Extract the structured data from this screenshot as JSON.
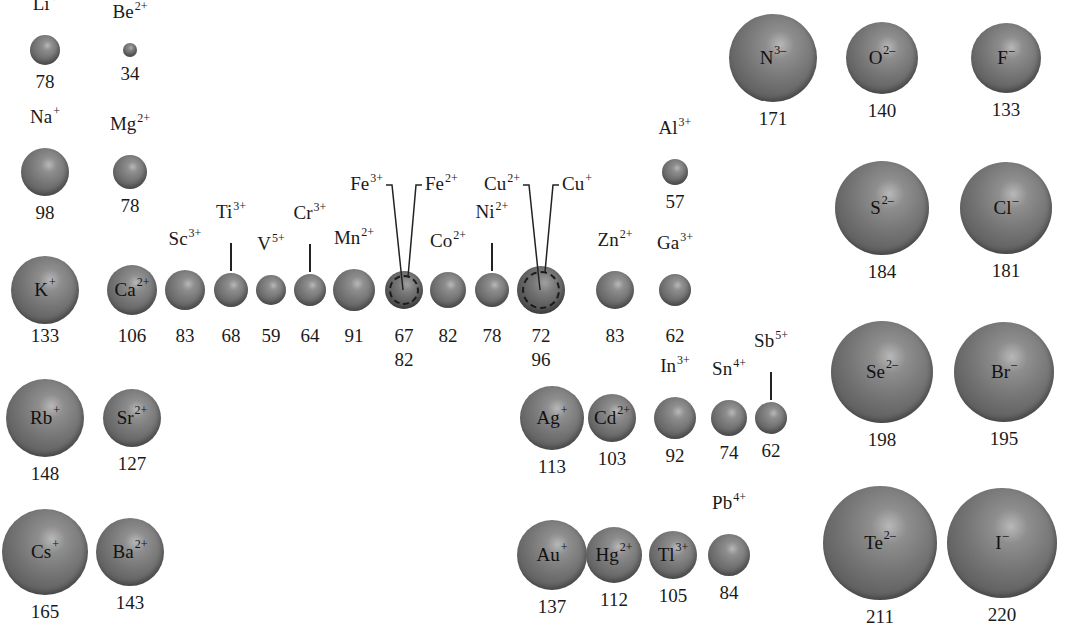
{
  "figure": {
    "units": "pm"
  },
  "ions": [
    {
      "id": "li",
      "symbol": "Li",
      "charge": "+",
      "radius": "78",
      "cx": 45,
      "cy": 50,
      "r": 15,
      "label_pos": "top"
    },
    {
      "id": "be",
      "symbol": "Be",
      "charge": "2+",
      "radius": "34",
      "cx": 130,
      "cy": 50,
      "r": 7,
      "label_pos": "top"
    },
    {
      "id": "na",
      "symbol": "Na",
      "charge": "+",
      "radius": "98",
      "cx": 45,
      "cy": 172,
      "r": 24,
      "label_pos": "top"
    },
    {
      "id": "mg",
      "symbol": "Mg",
      "charge": "2+",
      "radius": "78",
      "cx": 130,
      "cy": 172,
      "r": 17,
      "label_pos": "top"
    },
    {
      "id": "al",
      "symbol": "Al",
      "charge": "3+",
      "radius": "57",
      "cx": 675,
      "cy": 172,
      "r": 13,
      "label_pos": "top"
    },
    {
      "id": "k",
      "symbol": "K",
      "charge": "+",
      "radius": "133",
      "cx": 45,
      "cy": 290,
      "r": 34,
      "label_pos": "in"
    },
    {
      "id": "ca",
      "symbol": "Ca",
      "charge": "2+",
      "radius": "106",
      "cx": 132,
      "cy": 290,
      "r": 25,
      "label_pos": "in"
    },
    {
      "id": "sc",
      "symbol": "Sc",
      "charge": "3+",
      "radius": "83",
      "cx": 185,
      "cy": 290,
      "r": 20,
      "label_pos": "top"
    },
    {
      "id": "ti",
      "symbol": "Ti",
      "charge": "3+",
      "radius": "68",
      "cx": 231,
      "cy": 290,
      "r": 17,
      "label_pos": "top-line"
    },
    {
      "id": "v",
      "symbol": "V",
      "charge": "5+",
      "radius": "59",
      "cx": 271,
      "cy": 290,
      "r": 15,
      "label_pos": "top"
    },
    {
      "id": "cr",
      "symbol": "Cr",
      "charge": "3+",
      "radius": "64",
      "cx": 310,
      "cy": 290,
      "r": 16,
      "label_pos": "top-line"
    },
    {
      "id": "mn",
      "symbol": "Mn",
      "charge": "2+",
      "radius": "91",
      "cx": 354,
      "cy": 290,
      "r": 21,
      "label_pos": "top"
    },
    {
      "id": "co",
      "symbol": "Co",
      "charge": "2+",
      "radius": "82",
      "cx": 448,
      "cy": 290,
      "r": 18,
      "label_pos": "top"
    },
    {
      "id": "ni",
      "symbol": "Ni",
      "charge": "2+",
      "radius": "78",
      "cx": 492,
      "cy": 290,
      "r": 17,
      "label_pos": "top-line"
    },
    {
      "id": "zn",
      "symbol": "Zn",
      "charge": "2+",
      "radius": "83",
      "cx": 615,
      "cy": 290,
      "r": 19,
      "label_pos": "top"
    },
    {
      "id": "ga",
      "symbol": "Ga",
      "charge": "3+",
      "radius": "62",
      "cx": 675,
      "cy": 290,
      "r": 16,
      "label_pos": "top"
    },
    {
      "id": "rb",
      "symbol": "Rb",
      "charge": "+",
      "radius": "148",
      "cx": 45,
      "cy": 418,
      "r": 39,
      "label_pos": "in"
    },
    {
      "id": "sr",
      "symbol": "Sr",
      "charge": "2+",
      "radius": "127",
      "cx": 132,
      "cy": 418,
      "r": 29,
      "label_pos": "in"
    },
    {
      "id": "ag",
      "symbol": "Ag",
      "charge": "+",
      "radius": "113",
      "cx": 552,
      "cy": 418,
      "r": 32,
      "label_pos": "in"
    },
    {
      "id": "cd",
      "symbol": "Cd",
      "charge": "2+",
      "radius": "103",
      "cx": 612,
      "cy": 418,
      "r": 24,
      "label_pos": "in"
    },
    {
      "id": "in",
      "symbol": "In",
      "charge": "3+",
      "radius": "92",
      "cx": 675,
      "cy": 418,
      "r": 21,
      "label_pos": "top"
    },
    {
      "id": "sn",
      "symbol": "Sn",
      "charge": "4+",
      "radius": "74",
      "cx": 729,
      "cy": 418,
      "r": 18,
      "label_pos": "top"
    },
    {
      "id": "sb",
      "symbol": "Sb",
      "charge": "5+",
      "radius": "62",
      "cx": 771,
      "cy": 418,
      "r": 16,
      "label_pos": "top-line"
    },
    {
      "id": "cs",
      "symbol": "Cs",
      "charge": "+",
      "radius": "165",
      "cx": 45,
      "cy": 552,
      "r": 43,
      "label_pos": "in"
    },
    {
      "id": "ba",
      "symbol": "Ba",
      "charge": "2+",
      "radius": "143",
      "cx": 130,
      "cy": 552,
      "r": 34,
      "label_pos": "in"
    },
    {
      "id": "au",
      "symbol": "Au",
      "charge": "+",
      "radius": "137",
      "cx": 552,
      "cy": 555,
      "r": 35,
      "label_pos": "in"
    },
    {
      "id": "hg",
      "symbol": "Hg",
      "charge": "2+",
      "radius": "112",
      "cx": 614,
      "cy": 555,
      "r": 28,
      "label_pos": "in"
    },
    {
      "id": "tl",
      "symbol": "Tl",
      "charge": "3+",
      "radius": "105",
      "cx": 673,
      "cy": 555,
      "r": 24,
      "label_pos": "in"
    },
    {
      "id": "pb",
      "symbol": "Pb",
      "charge": "4+",
      "radius": "84",
      "cx": 729,
      "cy": 555,
      "r": 21,
      "label_pos": "top"
    },
    {
      "id": "n",
      "symbol": "N",
      "charge": "3–",
      "radius": "171",
      "cx": 773,
      "cy": 58,
      "r": 44,
      "label_pos": "in"
    },
    {
      "id": "o",
      "symbol": "O",
      "charge": "2–",
      "radius": "140",
      "cx": 882,
      "cy": 58,
      "r": 36,
      "label_pos": "in"
    },
    {
      "id": "f",
      "symbol": "F",
      "charge": "–",
      "radius": "133",
      "cx": 1006,
      "cy": 58,
      "r": 35,
      "label_pos": "in"
    },
    {
      "id": "s",
      "symbol": "S",
      "charge": "2–",
      "radius": "184",
      "cx": 882,
      "cy": 208,
      "r": 47,
      "label_pos": "in"
    },
    {
      "id": "cl",
      "symbol": "Cl",
      "charge": "–",
      "radius": "181",
      "cx": 1006,
      "cy": 208,
      "r": 46,
      "label_pos": "in"
    },
    {
      "id": "se",
      "symbol": "Se",
      "charge": "2–",
      "radius": "198",
      "cx": 882,
      "cy": 372,
      "r": 51,
      "label_pos": "in"
    },
    {
      "id": "br",
      "symbol": "Br",
      "charge": "–",
      "radius": "195",
      "cx": 1004,
      "cy": 372,
      "r": 50,
      "label_pos": "in"
    },
    {
      "id": "te",
      "symbol": "Te",
      "charge": "2–",
      "radius": "211",
      "cx": 880,
      "cy": 543,
      "r": 57,
      "label_pos": "in"
    },
    {
      "id": "i",
      "symbol": "I",
      "charge": "–",
      "radius": "220",
      "cx": 1002,
      "cy": 543,
      "r": 55,
      "label_pos": "in"
    }
  ],
  "paired_ions": [
    {
      "id": "fe",
      "cx": 404,
      "cy": 290,
      "r": 19,
      "left": {
        "symbol": "Fe",
        "charge": "3+",
        "radius": "67"
      },
      "right": {
        "symbol": "Fe",
        "charge": "2+",
        "radius": "82"
      }
    },
    {
      "id": "cu",
      "cx": 541,
      "cy": 290,
      "r": 24,
      "left": {
        "symbol": "Cu",
        "charge": "2+",
        "radius": "72"
      },
      "right": {
        "symbol": "Cu",
        "charge": "+",
        "radius": "96"
      }
    }
  ]
}
